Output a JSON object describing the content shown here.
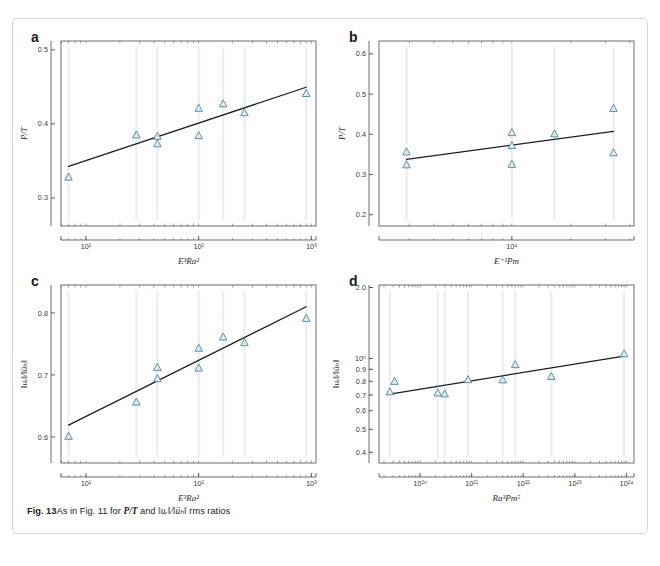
{
  "figure": {
    "caption_prefix": "Fig. 13",
    "caption_text_1": "As in Fig. 11 for ",
    "caption_math_1": "P/T",
    "caption_text_2": " and ",
    "caption_math_2": "‖uᵣ‖/‖ūₕ‖",
    "caption_text_3": " rms ratios"
  },
  "style": {
    "marker_stroke": "#4a7f94",
    "marker_fill": "#dfeaf0",
    "fit_line": "#1d1d1d",
    "axis_color": "#4a4a4a",
    "errorbar_color": "#e8eef2",
    "card_border": "#d7d7d7",
    "background": "#ffffff"
  },
  "chart_data": [
    {
      "panel": "a",
      "type": "scatter",
      "title": "",
      "xlabel": "E³Ra²",
      "ylabel": "P/T",
      "xscale": "log",
      "yscale": "linear",
      "xlim": [
        6.0,
        1100.0
      ],
      "ylim": [
        0.262,
        0.512
      ],
      "xticks": [
        10,
        100,
        1000
      ],
      "xtick_labels": [
        "10¹",
        "10²",
        "10³"
      ],
      "yticks": [
        0.3,
        0.4,
        0.5
      ],
      "ytick_labels": [
        "0.3",
        "0.4",
        "0.5"
      ],
      "grid": false,
      "legend": "none",
      "points": [
        {
          "x": 7.0,
          "y": 0.328
        },
        {
          "x": 28.0,
          "y": 0.385
        },
        {
          "x": 43.0,
          "y": 0.383
        },
        {
          "x": 43.0,
          "y": 0.373
        },
        {
          "x": 100.0,
          "y": 0.421
        },
        {
          "x": 100.0,
          "y": 0.384
        },
        {
          "x": 165.0,
          "y": 0.427
        },
        {
          "x": 255.0,
          "y": 0.415
        },
        {
          "x": 900.0,
          "y": 0.441
        }
      ],
      "error_bars_x": [
        7.0,
        28.0,
        43.0,
        100.0,
        165.0,
        255.0,
        900.0
      ],
      "fit_line": {
        "x0": 7.0,
        "y0": 0.3425,
        "x1": 900.0,
        "y1": 0.4495
      }
    },
    {
      "panel": "b",
      "type": "scatter",
      "title": "",
      "xlabel": "E⁻¹Pm",
      "ylabel": "P/T",
      "xscale": "log",
      "yscale": "linear",
      "xlim": [
        2100.0,
        42000.0
      ],
      "ylim": [
        0.172,
        0.632
      ],
      "xticks": [
        10000
      ],
      "xtick_labels": [
        "10⁴"
      ],
      "yticks": [
        0.2,
        0.3,
        0.4,
        0.5,
        0.6
      ],
      "ytick_labels": [
        "0.2",
        "0.3",
        "0.4",
        "0.5",
        "0.6"
      ],
      "grid": false,
      "legend": "none",
      "points": [
        {
          "x": 2900.0,
          "y": 0.356
        },
        {
          "x": 2900.0,
          "y": 0.324
        },
        {
          "x": 10000.0,
          "y": 0.404
        },
        {
          "x": 10000.0,
          "y": 0.372
        },
        {
          "x": 10000.0,
          "y": 0.325
        },
        {
          "x": 16500.0,
          "y": 0.401
        },
        {
          "x": 33000.0,
          "y": 0.464
        },
        {
          "x": 33000.0,
          "y": 0.354
        }
      ],
      "error_bars_x": [
        2900.0,
        10000.0,
        16500.0,
        33000.0
      ],
      "fit_line": {
        "x0": 2900.0,
        "y0": 0.3375,
        "x1": 33000.0,
        "y1": 0.4075
      }
    },
    {
      "panel": "c",
      "type": "scatter",
      "title": "",
      "xlabel": "E³Ra²",
      "ylabel": "‖uᵣ‖/‖ūₕ‖",
      "xscale": "log",
      "yscale": "linear",
      "xlim": [
        6.0,
        1100.0
      ],
      "ylim": [
        0.558,
        0.845
      ],
      "xticks": [
        10,
        100,
        1000
      ],
      "xtick_labels": [
        "10¹",
        "10²",
        "10³"
      ],
      "yticks": [
        0.6,
        0.7,
        0.8
      ],
      "ytick_labels": [
        "0.6",
        "0.7",
        "0.8"
      ],
      "grid": false,
      "legend": "none",
      "points": [
        {
          "x": 7.0,
          "y": 0.601
        },
        {
          "x": 28.0,
          "y": 0.656
        },
        {
          "x": 43.0,
          "y": 0.712
        },
        {
          "x": 43.0,
          "y": 0.694
        },
        {
          "x": 100.0,
          "y": 0.743
        },
        {
          "x": 100.0,
          "y": 0.711
        },
        {
          "x": 165.0,
          "y": 0.761
        },
        {
          "x": 255.0,
          "y": 0.752
        },
        {
          "x": 900.0,
          "y": 0.791
        }
      ],
      "error_bars_x": [
        7.0,
        28.0,
        43.0,
        100.0,
        165.0,
        255.0,
        900.0
      ],
      "fit_line": {
        "x0": 7.0,
        "y0": 0.619,
        "x1": 900.0,
        "y1": 0.81
      }
    },
    {
      "panel": "d",
      "type": "scatter",
      "title": "",
      "xlabel": "Ra³Pm⁵",
      "ylabel": "‖uᵣ‖/‖ūₕ‖",
      "xscale": "log",
      "yscale": "log",
      "xlim": [
        1.6e+19,
        1.4e+24
      ],
      "ylim": [
        0.36,
        2.05
      ],
      "xticks": [
        1e+20,
        1e+21,
        1e+22,
        1e+23,
        1e+24
      ],
      "xtick_labels": [
        "10²⁰",
        "10²¹",
        "10²²",
        "10²³",
        "10²⁴"
      ],
      "yticks": [
        0.4,
        0.5,
        0.6,
        0.7,
        0.8,
        0.9,
        1.0,
        2.0
      ],
      "ytick_labels": [
        "0.4",
        "0.5",
        "0.6",
        "0.7",
        "0.8",
        "0.9",
        "10⁰",
        "2.0"
      ],
      "grid": false,
      "legend": "none",
      "points": [
        {
          "x": 2.6e+19,
          "y": 0.721
        },
        {
          "x": 3.2e+19,
          "y": 0.799
        },
        {
          "x": 2.2e+20,
          "y": 0.713
        },
        {
          "x": 3e+20,
          "y": 0.707
        },
        {
          "x": 8.5e+20,
          "y": 0.812
        },
        {
          "x": 4e+21,
          "y": 0.811
        },
        {
          "x": 7e+21,
          "y": 0.941
        },
        {
          "x": 3.5e+22,
          "y": 0.838
        },
        {
          "x": 9e+23,
          "y": 1.046
        }
      ],
      "error_bars_x": [
        2.6e+19,
        2.2e+20,
        3e+20,
        8.5e+20,
        4e+21,
        7e+21,
        3.5e+22,
        9e+23
      ],
      "fit_line": {
        "x0": 2.6e+19,
        "y0": 0.706,
        "x1": 9e+23,
        "y1": 1.022
      }
    }
  ]
}
